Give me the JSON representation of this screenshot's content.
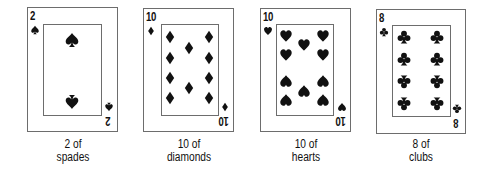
{
  "cards": [
    {
      "rank": "2",
      "suit": "spades",
      "suit_icon": "spade-icon",
      "caption_line1": "2 of",
      "caption_line2": "spades",
      "box": {
        "left": 27,
        "top": 7,
        "width": 91,
        "height": 125
      },
      "inner": {
        "left": 43,
        "top": 24,
        "width": 59,
        "height": 92
      },
      "pips": [
        {
          "x": 72,
          "y": 40,
          "size": 15,
          "inverted": false
        },
        {
          "x": 72,
          "y": 102,
          "size": 15,
          "inverted": true
        }
      ]
    },
    {
      "rank": "10",
      "suit": "diamonds",
      "suit_icon": "diamond-icon",
      "caption_line1": "10 of",
      "caption_line2": "diamonds",
      "box": {
        "left": 143,
        "top": 8,
        "width": 91,
        "height": 124
      },
      "inner": {
        "left": 161,
        "top": 24,
        "width": 58,
        "height": 92
      },
      "pips": [
        {
          "x": 170,
          "y": 37,
          "size": 13,
          "inverted": false
        },
        {
          "x": 170,
          "y": 58,
          "size": 13,
          "inverted": false
        },
        {
          "x": 170,
          "y": 78,
          "size": 13,
          "inverted": false
        },
        {
          "x": 170,
          "y": 98,
          "size": 13,
          "inverted": false
        },
        {
          "x": 209,
          "y": 37,
          "size": 13,
          "inverted": false
        },
        {
          "x": 209,
          "y": 58,
          "size": 13,
          "inverted": false
        },
        {
          "x": 209,
          "y": 78,
          "size": 13,
          "inverted": false
        },
        {
          "x": 209,
          "y": 98,
          "size": 13,
          "inverted": false
        },
        {
          "x": 189,
          "y": 48,
          "size": 13,
          "inverted": false
        },
        {
          "x": 189,
          "y": 88,
          "size": 13,
          "inverted": false
        }
      ]
    },
    {
      "rank": "10",
      "suit": "hearts",
      "suit_icon": "heart-icon",
      "caption_line1": "10 of",
      "caption_line2": "hearts",
      "box": {
        "left": 260,
        "top": 8,
        "width": 91,
        "height": 124
      },
      "inner": {
        "left": 276,
        "top": 24,
        "width": 58,
        "height": 92
      },
      "pips": [
        {
          "x": 286,
          "y": 36,
          "size": 13,
          "inverted": false
        },
        {
          "x": 286,
          "y": 55,
          "size": 13,
          "inverted": false
        },
        {
          "x": 286,
          "y": 81,
          "size": 13,
          "inverted": true
        },
        {
          "x": 286,
          "y": 100,
          "size": 13,
          "inverted": true
        },
        {
          "x": 323,
          "y": 36,
          "size": 13,
          "inverted": false
        },
        {
          "x": 323,
          "y": 55,
          "size": 13,
          "inverted": false
        },
        {
          "x": 323,
          "y": 81,
          "size": 13,
          "inverted": true
        },
        {
          "x": 323,
          "y": 100,
          "size": 13,
          "inverted": true
        },
        {
          "x": 304,
          "y": 45,
          "size": 13,
          "inverted": false
        },
        {
          "x": 304,
          "y": 91,
          "size": 13,
          "inverted": true
        }
      ]
    },
    {
      "rank": "8",
      "suit": "clubs",
      "suit_icon": "club-icon",
      "caption_line1": "8 of",
      "caption_line2": "clubs",
      "box": {
        "left": 376,
        "top": 9,
        "width": 90,
        "height": 125
      },
      "inner": {
        "left": 392,
        "top": 25,
        "width": 59,
        "height": 92
      },
      "pips": [
        {
          "x": 404,
          "y": 37,
          "size": 14,
          "inverted": false
        },
        {
          "x": 404,
          "y": 59,
          "size": 14,
          "inverted": false
        },
        {
          "x": 404,
          "y": 82,
          "size": 14,
          "inverted": true
        },
        {
          "x": 404,
          "y": 104,
          "size": 14,
          "inverted": true
        },
        {
          "x": 437,
          "y": 37,
          "size": 14,
          "inverted": false
        },
        {
          "x": 437,
          "y": 59,
          "size": 14,
          "inverted": false
        },
        {
          "x": 437,
          "y": 82,
          "size": 14,
          "inverted": true
        },
        {
          "x": 437,
          "y": 104,
          "size": 14,
          "inverted": true
        }
      ]
    }
  ],
  "colors": {
    "ink": "#111111",
    "border": "#6d6d6d",
    "background": "#ffffff"
  }
}
